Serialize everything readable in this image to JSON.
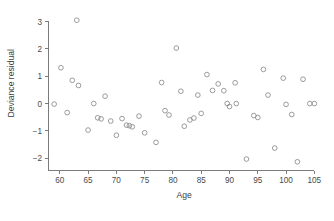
{
  "chart_data": {
    "type": "scatter",
    "title": "",
    "xlabel": "Age",
    "ylabel": "Deviance residual",
    "xlim": [
      58.0,
      106.0
    ],
    "ylim": [
      -2.45,
      3.35
    ],
    "grid": false,
    "legend": null,
    "xticks": [
      60,
      65,
      70,
      75,
      80,
      85,
      90,
      95,
      100,
      105
    ],
    "xticklabels": [
      "60",
      "65",
      "70",
      "75",
      "80",
      "85",
      "90",
      "95",
      "100",
      "105"
    ],
    "yticks": [
      -2,
      -1,
      0,
      1,
      2,
      3
    ],
    "yticklabels": [
      "−2",
      "−1",
      "0",
      "1",
      "2",
      "3"
    ],
    "marker": "open-circle",
    "marker_color": "#8a8a8a",
    "x": [
      59.0,
      60.2,
      61.3,
      62.2,
      63.0,
      63.3,
      65.0,
      66.0,
      66.7,
      67.3,
      68.0,
      69.0,
      70.0,
      71.0,
      71.8,
      72.3,
      72.8,
      74.0,
      75.0,
      77.0,
      78.0,
      78.6,
      79.3,
      80.6,
      81.4,
      82.0,
      83.0,
      83.7,
      84.4,
      85.0,
      86.0,
      87.0,
      88.0,
      89.0,
      89.6,
      90.0,
      91.0,
      91.2,
      93.0,
      94.3,
      95.0,
      96.0,
      96.8,
      98.0,
      99.5,
      100.0,
      101.0,
      102.0,
      103.0,
      104.2,
      105.0
    ],
    "y": [
      -0.02,
      1.31,
      -0.33,
      0.85,
      3.05,
      0.66,
      -0.97,
      0.0,
      -0.52,
      -0.56,
      0.27,
      -0.64,
      -1.16,
      -0.55,
      -0.79,
      -0.81,
      -0.85,
      -0.46,
      -1.07,
      -1.42,
      0.77,
      -0.26,
      -0.42,
      2.03,
      0.45,
      -0.83,
      -0.6,
      -0.53,
      0.31,
      -0.36,
      1.06,
      0.48,
      0.72,
      0.47,
      0.0,
      -0.11,
      0.76,
      0.0,
      -2.03,
      -0.44,
      -0.51,
      1.25,
      0.31,
      -1.63,
      0.93,
      -0.03,
      -0.4,
      -2.13,
      0.89,
      0.0,
      0.0
    ],
    "n_points": 51
  },
  "axes": {
    "x_axis_label": "Age",
    "y_axis_label": "Deviance residual"
  }
}
